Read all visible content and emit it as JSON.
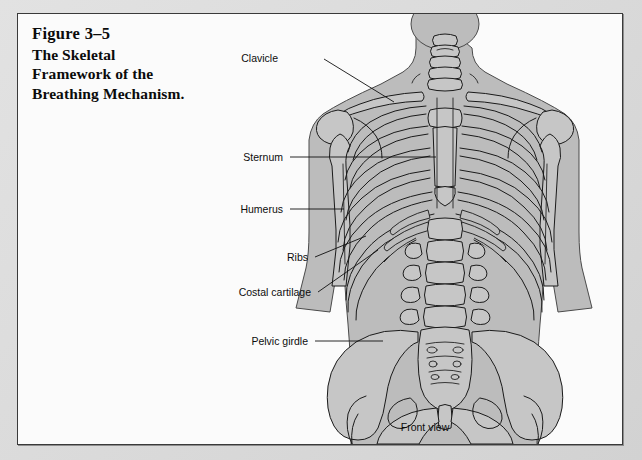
{
  "figure": {
    "number": "Figure 3–5",
    "caption_lines": [
      "The Skeletal",
      "Framework of the",
      "Breathing Mechanism."
    ],
    "view_caption": "Front view"
  },
  "labels": [
    {
      "id": "clavicle",
      "text": "Clavicle"
    },
    {
      "id": "sternum",
      "text": "Sternum"
    },
    {
      "id": "humerus",
      "text": "Humerus"
    },
    {
      "id": "ribs",
      "text": "Ribs"
    },
    {
      "id": "costal-cartilage",
      "text": "Costal cartilage"
    },
    {
      "id": "pelvic-girdle",
      "text": "Pelvic girdle"
    }
  ],
  "colors": {
    "page": "#fbfbfb",
    "border": "#3a3a3a",
    "body_silhouette": "#bcbcbc",
    "bone_fill": "#c6c6c6",
    "ink": "#1a1a1a",
    "text": "#0d0d0d"
  }
}
